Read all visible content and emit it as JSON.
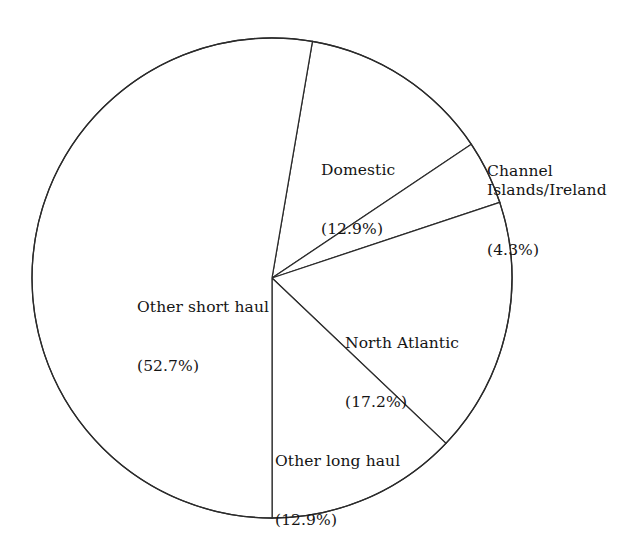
{
  "chart_data": {
    "type": "pie",
    "title": "",
    "subtitle": "",
    "xlabel": "",
    "ylabel": "",
    "legend": "none",
    "grid": false,
    "start_angle_deg_clockwise_from_top": 9.7,
    "direction": "clockwise",
    "categories": [
      "Domestic",
      "Channel Islands/Ireland",
      "North Atlantic",
      "Other long haul",
      "Other short haul"
    ],
    "values": [
      12.9,
      4.3,
      17.2,
      12.9,
      52.7
    ],
    "value_unit": "percent",
    "slices": [
      {
        "name": "Domestic",
        "label_line1": "Domestic",
        "label_line2": "(12.9%)",
        "value": 12.9,
        "angle_deg": 46.4,
        "fill": "#ffffff",
        "stroke": "#2b2b2b"
      },
      {
        "name": "Channel Islands/Ireland",
        "label_line1": "Channel\nIslands/Ireland",
        "label_line2": "(4.3%)",
        "value": 4.3,
        "angle_deg": 15.5,
        "fill": "#ffffff",
        "stroke": "#2b2b2b"
      },
      {
        "name": "North Atlantic",
        "label_line1": "North Atlantic",
        "label_line2": "(17.2%)",
        "value": 17.2,
        "angle_deg": 61.9,
        "fill": "#ffffff",
        "stroke": "#2b2b2b"
      },
      {
        "name": "Other long haul",
        "label_line1": "Other long haul",
        "label_line2": "(12.9%)",
        "value": 12.9,
        "angle_deg": 46.4,
        "fill": "#ffffff",
        "stroke": "#2b2b2b"
      },
      {
        "name": "Other short haul",
        "label_line1": "Other short haul",
        "label_line2": "(52.7%)",
        "value": 52.7,
        "angle_deg": 189.7,
        "fill": "#ffffff",
        "stroke": "#2b2b2b"
      }
    ],
    "geometry": {
      "center_x": 272,
      "center_y": 278,
      "radius": 240
    },
    "colors": {
      "background": "#ffffff",
      "line": "#2b2b2b",
      "text": "#141414"
    }
  }
}
